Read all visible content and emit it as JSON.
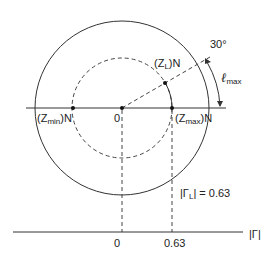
{
  "diagram": {
    "labels": {
      "zl": {
        "pre": "(Z",
        "sub": "L",
        "post": ")N"
      },
      "zmin": {
        "pre": "(Z",
        "sub": "min",
        "post": ")N"
      },
      "zmax": {
        "pre": "(Z",
        "sub": "max",
        "post": ")N"
      },
      "center": "0",
      "angle": "30°",
      "lmax": {
        "main": "ℓ",
        "sub": "max"
      },
      "gamma_l": {
        "pre": "|Γ",
        "sub": "L",
        "post": "| = 0.63"
      },
      "axis_label": "|Γ|",
      "tick_zero": "0",
      "tick_063": "0.63"
    },
    "geometry": {
      "center": [
        122,
        108
      ],
      "outer_radius": 87,
      "dashed_radius": 50,
      "angle_deg": 30,
      "gamma_magnitude": 0.63
    },
    "colors": {
      "line": "#333333"
    }
  }
}
